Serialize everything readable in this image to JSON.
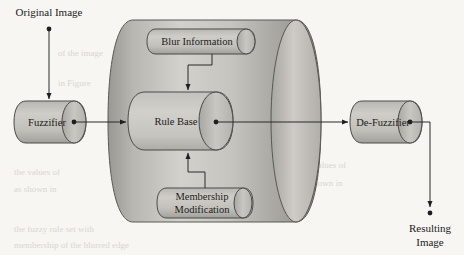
{
  "diagram": {
    "background_color": "#f7f6f3",
    "shape_fill_light": "#cfcdc8",
    "shape_fill_mid": "#b3b1ab",
    "shape_fill_dark": "#87857f",
    "stroke_color": "#4a4a4a",
    "text_color": "#1a1a1a"
  },
  "labels": {
    "original_image": "Original Image",
    "resulting_image_line1": "Resulting",
    "resulting_image_line2": "Image"
  },
  "nodes": {
    "fuzzifier": {
      "label": "Fuzzifier"
    },
    "defuzzifier": {
      "label": "De-Fuzzifier"
    },
    "rule_base": {
      "label": "Rule Base"
    },
    "blur_information": {
      "label": "Blur Information"
    },
    "membership_modification": {
      "line1": "Membership",
      "line2": "Modification"
    }
  },
  "ghost_text": {
    "rows": [
      "of the image",
      "in Figure",
      "the values of",
      "as shown in",
      "the fuzzy rule set with",
      "membership of the blurred edge"
    ]
  }
}
